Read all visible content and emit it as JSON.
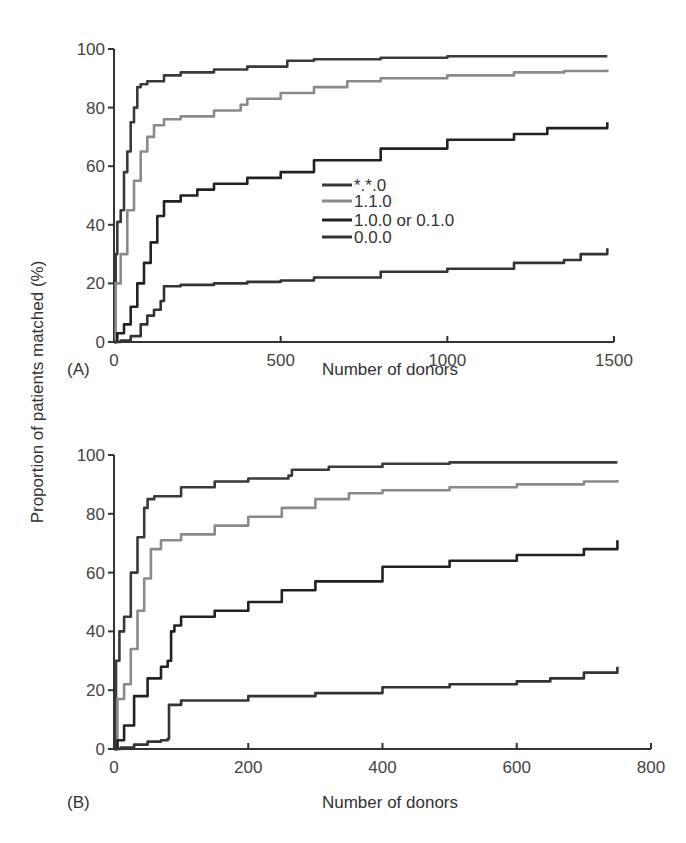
{
  "figure": {
    "ylabel": "Proportion of patients matched (%)",
    "legend": [
      {
        "label": "*.*.0",
        "color": "#3a3a3a"
      },
      {
        "label": "1.1.0",
        "color": "#8a8a8a"
      },
      {
        "label": "1.0.0 or 0.1.0",
        "color": "#222222"
      },
      {
        "label": "0.0.0",
        "color": "#333333"
      }
    ]
  },
  "chart_data": [
    {
      "type": "line",
      "panel": "(A)",
      "title": "",
      "xlabel": "Number of donors",
      "ylabel": "Proportion of patients matched (%)",
      "xlim": [
        0,
        1500
      ],
      "ylim": [
        0,
        100
      ],
      "xticks": [
        0,
        500,
        1000,
        1500
      ],
      "yticks": [
        0,
        20,
        40,
        60,
        80,
        100
      ],
      "grid": false,
      "legend_position": "center",
      "series": [
        {
          "name": "*.*.0",
          "x": [
            0,
            5,
            10,
            20,
            30,
            40,
            50,
            60,
            70,
            80,
            100,
            150,
            200,
            300,
            400,
            500,
            520,
            600,
            800,
            1000,
            1200,
            1480
          ],
          "y": [
            0,
            30,
            41,
            45,
            58,
            65,
            75,
            80,
            87,
            88,
            89,
            91,
            92,
            93,
            94,
            94,
            96,
            96.5,
            97,
            97.5,
            97.5,
            97.5
          ]
        },
        {
          "name": "1.1.0",
          "x": [
            0,
            5,
            20,
            40,
            60,
            80,
            100,
            120,
            150,
            200,
            300,
            380,
            400,
            500,
            600,
            700,
            800,
            1000,
            1200,
            1350,
            1480
          ],
          "y": [
            0,
            20,
            30,
            45,
            55,
            65,
            70,
            74,
            76,
            77,
            79,
            81,
            83,
            85,
            87,
            89,
            90,
            91,
            92,
            92.5,
            93
          ]
        },
        {
          "name": "1.0.0 or 0.1.0",
          "x": [
            0,
            10,
            30,
            50,
            70,
            90,
            110,
            130,
            150,
            200,
            250,
            300,
            400,
            500,
            600,
            800,
            1000,
            1200,
            1300,
            1480
          ],
          "y": [
            0,
            3,
            6,
            12,
            20,
            27,
            34,
            43,
            48,
            50,
            52,
            54,
            56,
            58,
            62,
            66,
            69,
            71,
            73,
            75
          ]
        },
        {
          "name": "0.0.0",
          "x": [
            0,
            20,
            50,
            80,
            100,
            120,
            140,
            150,
            200,
            300,
            400,
            500,
            600,
            800,
            1000,
            1200,
            1350,
            1400,
            1480
          ],
          "y": [
            0,
            0.5,
            2,
            6,
            9,
            11,
            14,
            19,
            19.5,
            20,
            20.5,
            21,
            22,
            24,
            25,
            27,
            28,
            30,
            32
          ]
        }
      ]
    },
    {
      "type": "line",
      "panel": "(B)",
      "title": "",
      "xlabel": "Number of donors",
      "ylabel": "Proportion of patients matched (%)",
      "xlim": [
        0,
        800
      ],
      "ylim": [
        0,
        100
      ],
      "xticks": [
        0,
        200,
        400,
        600,
        800
      ],
      "yticks": [
        0,
        20,
        40,
        60,
        80,
        100
      ],
      "grid": false,
      "legend_position": "none",
      "series": [
        {
          "name": "*.*.0",
          "x": [
            0,
            3,
            8,
            15,
            25,
            35,
            45,
            50,
            60,
            100,
            150,
            200,
            260,
            265,
            320,
            400,
            500,
            600,
            750
          ],
          "y": [
            0,
            30,
            40,
            45,
            60,
            72,
            82,
            85,
            86,
            89,
            91,
            92,
            93,
            95,
            96,
            97,
            97.5,
            97.5,
            97.5
          ]
        },
        {
          "name": "1.1.0",
          "x": [
            0,
            5,
            15,
            25,
            35,
            45,
            55,
            70,
            100,
            150,
            200,
            250,
            300,
            350,
            400,
            500,
            600,
            700,
            750
          ],
          "y": [
            0,
            17,
            22,
            34,
            47,
            58,
            68,
            71,
            73,
            76,
            79,
            82,
            85,
            87,
            88,
            89,
            90,
            91,
            91.5
          ]
        },
        {
          "name": "1.0.0 or 0.1.0",
          "x": [
            0,
            5,
            15,
            30,
            50,
            70,
            80,
            85,
            90,
            100,
            150,
            200,
            250,
            300,
            400,
            500,
            600,
            700,
            750
          ],
          "y": [
            0,
            3,
            8,
            18,
            24,
            28,
            30,
            40,
            42,
            45,
            47,
            50,
            54,
            57,
            62,
            64,
            66,
            68,
            71
          ]
        },
        {
          "name": "0.0.0",
          "x": [
            0,
            10,
            30,
            50,
            70,
            80,
            82,
            100,
            200,
            300,
            400,
            500,
            600,
            650,
            700,
            750
          ],
          "y": [
            0,
            0.5,
            1.5,
            2.5,
            3,
            3.5,
            15,
            16.5,
            18,
            19,
            21,
            22,
            23,
            24,
            26,
            28
          ]
        }
      ]
    }
  ]
}
